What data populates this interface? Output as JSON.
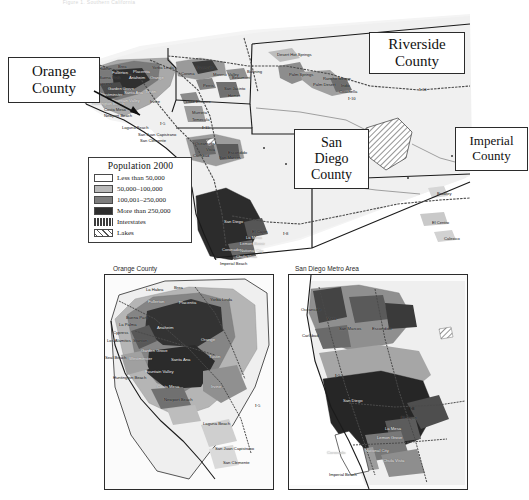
{
  "figure": {
    "top_caption": "Figure 1. Southern California"
  },
  "legend": {
    "title": "Population 2000",
    "items": [
      {
        "label": "Less than 50,000",
        "swatch": "#ffffff",
        "type": "area"
      },
      {
        "label": "50,000–100,000",
        "swatch": "#b9b9b9",
        "type": "area"
      },
      {
        "label": "100,001–250,000",
        "swatch": "#7d7d7d",
        "type": "area"
      },
      {
        "label": "More than 250,000",
        "swatch": "#2e2e2e",
        "type": "area"
      },
      {
        "label": "Interstates",
        "swatch": "#3c3c3c",
        "type": "road"
      },
      {
        "label": "Lakes",
        "swatch": "#ffffff",
        "type": "lake"
      }
    ]
  },
  "callouts": [
    {
      "name": "orange-county",
      "line1": "Orange",
      "line2": "County",
      "line3": ""
    },
    {
      "name": "riverside-county",
      "line1": "Riverside",
      "line2": "County",
      "line3": ""
    },
    {
      "name": "san-diego-county",
      "line1": "San",
      "line2": "Diego",
      "line3": "County"
    },
    {
      "name": "imperial-county",
      "line1": "Imperial",
      "line2": "County",
      "line3": ""
    }
  ],
  "main_map": {
    "cities": [
      {
        "name": "La Habra",
        "x": 93,
        "y": 59,
        "tone": "dark"
      },
      {
        "name": "Brea",
        "x": 118,
        "y": 57,
        "tone": "dark"
      },
      {
        "name": "Fullerton",
        "x": 112,
        "y": 63,
        "tone": "light"
      },
      {
        "name": "Placentia",
        "x": 133,
        "y": 62,
        "tone": "light"
      },
      {
        "name": "Yorba Linda",
        "x": 152,
        "y": 58,
        "tone": "dark"
      },
      {
        "name": "Anaheim",
        "x": 129,
        "y": 68,
        "tone": "light"
      },
      {
        "name": "Orange",
        "x": 150,
        "y": 68,
        "tone": "light"
      },
      {
        "name": "Buena Park",
        "x": 99,
        "y": 68,
        "tone": "dark"
      },
      {
        "name": "Cypress",
        "x": 97,
        "y": 74,
        "tone": "dark"
      },
      {
        "name": "Garden Grove",
        "x": 108,
        "y": 79,
        "tone": "light"
      },
      {
        "name": "Westminster",
        "x": 100,
        "y": 85,
        "tone": "light"
      },
      {
        "name": "Santa Ana",
        "x": 124,
        "y": 83,
        "tone": "light"
      },
      {
        "name": "Tustin",
        "x": 145,
        "y": 82,
        "tone": "light"
      },
      {
        "name": "Irvine",
        "x": 150,
        "y": 92,
        "tone": "dark"
      },
      {
        "name": "Huntington Beach",
        "x": 92,
        "y": 94,
        "tone": "light"
      },
      {
        "name": "Fountain Valley",
        "x": 112,
        "y": 91,
        "tone": "light"
      },
      {
        "name": "Costa Mesa",
        "x": 104,
        "y": 100,
        "tone": "dark"
      },
      {
        "name": "Newport Beach",
        "x": 104,
        "y": 106,
        "tone": "dark"
      },
      {
        "name": "Laguna Beach",
        "x": 122,
        "y": 118,
        "tone": "dark"
      },
      {
        "name": "San Juan Capistrano",
        "x": 138,
        "y": 125,
        "tone": "dark"
      },
      {
        "name": "San Clemente",
        "x": 140,
        "y": 131,
        "tone": "dark"
      },
      {
        "name": "Corona",
        "x": 181,
        "y": 64,
        "tone": "dark"
      },
      {
        "name": "Riverside",
        "x": 196,
        "y": 58,
        "tone": "dark"
      },
      {
        "name": "Moreno Valley",
        "x": 213,
        "y": 65,
        "tone": "dark"
      },
      {
        "name": "Lake Elsinore",
        "x": 186,
        "y": 92,
        "tone": "dark"
      },
      {
        "name": "Murrieta",
        "x": 192,
        "y": 103,
        "tone": "dark"
      },
      {
        "name": "Temecula",
        "x": 192,
        "y": 110,
        "tone": "dark"
      },
      {
        "name": "Perris",
        "x": 203,
        "y": 76,
        "tone": "dark"
      },
      {
        "name": "Hemet",
        "x": 228,
        "y": 86,
        "tone": "dark"
      },
      {
        "name": "San Jacinto",
        "x": 224,
        "y": 79,
        "tone": "dark"
      },
      {
        "name": "Beaumont",
        "x": 232,
        "y": 68,
        "tone": "dark"
      },
      {
        "name": "Banning",
        "x": 247,
        "y": 62,
        "tone": "dark"
      },
      {
        "name": "Desert Hot Springs",
        "x": 277,
        "y": 45,
        "tone": "dark"
      },
      {
        "name": "Palm Springs",
        "x": 289,
        "y": 65,
        "tone": "dark"
      },
      {
        "name": "Rancho Mirage",
        "x": 323,
        "y": 69,
        "tone": "dark"
      },
      {
        "name": "Palm Desert",
        "x": 313,
        "y": 75,
        "tone": "dark"
      },
      {
        "name": "Indio",
        "x": 341,
        "y": 76,
        "tone": "dark"
      },
      {
        "name": "Coachella",
        "x": 339,
        "y": 82,
        "tone": "dark"
      },
      {
        "name": "Oceanside",
        "x": 195,
        "y": 134,
        "tone": "dark"
      },
      {
        "name": "Vista",
        "x": 206,
        "y": 140,
        "tone": "dark"
      },
      {
        "name": "Carlsbad",
        "x": 193,
        "y": 146,
        "tone": "dark"
      },
      {
        "name": "San Marcos",
        "x": 219,
        "y": 148,
        "tone": "dark"
      },
      {
        "name": "Escondido",
        "x": 228,
        "y": 143,
        "tone": "dark"
      },
      {
        "name": "San Diego",
        "x": 224,
        "y": 212,
        "tone": "light"
      },
      {
        "name": "El Cajon",
        "x": 252,
        "y": 222,
        "tone": "dark"
      },
      {
        "name": "La Mesa",
        "x": 246,
        "y": 228,
        "tone": "light"
      },
      {
        "name": "Lemon Grove",
        "x": 240,
        "y": 234,
        "tone": "light"
      },
      {
        "name": "Coronado",
        "x": 222,
        "y": 240,
        "tone": "light"
      },
      {
        "name": "National City",
        "x": 240,
        "y": 241,
        "tone": "light"
      },
      {
        "name": "Chula Vista",
        "x": 236,
        "y": 247,
        "tone": "light"
      },
      {
        "name": "Imperial Beach",
        "x": 220,
        "y": 254,
        "tone": "dark"
      },
      {
        "name": "Brawley",
        "x": 437,
        "y": 184,
        "tone": "dark"
      },
      {
        "name": "El Centro",
        "x": 432,
        "y": 213,
        "tone": "dark"
      },
      {
        "name": "Calexico",
        "x": 444,
        "y": 229,
        "tone": "dark"
      }
    ],
    "interstate_shields": [
      {
        "label": "I-5",
        "x": 160,
        "y": 113
      },
      {
        "label": "I-15",
        "x": 202,
        "y": 117
      },
      {
        "label": "I-8",
        "x": 283,
        "y": 223
      },
      {
        "label": "I-10",
        "x": 348,
        "y": 88
      },
      {
        "label": "I-10",
        "x": 419,
        "y": 79
      }
    ]
  },
  "insets": [
    {
      "name": "orange-county-inset",
      "title": "Orange County",
      "cities": [
        {
          "name": "La Habra",
          "x": 41,
          "y": 13,
          "tone": "dark"
        },
        {
          "name": "Brea",
          "x": 69,
          "y": 11,
          "tone": "dark"
        },
        {
          "name": "Fullerton",
          "x": 43,
          "y": 25,
          "tone": "light"
        },
        {
          "name": "Placentia",
          "x": 74,
          "y": 26,
          "tone": "light"
        },
        {
          "name": "Yorba Linda",
          "x": 105,
          "y": 23,
          "tone": "dark"
        },
        {
          "name": "Buena Park",
          "x": 21,
          "y": 41,
          "tone": "dark"
        },
        {
          "name": "La Palma",
          "x": 14,
          "y": 48,
          "tone": "dark"
        },
        {
          "name": "Cypress",
          "x": 8,
          "y": 56,
          "tone": "dark"
        },
        {
          "name": "Los Alamitos",
          "x": 2,
          "y": 64,
          "tone": "dark"
        },
        {
          "name": "Stanton",
          "x": 28,
          "y": 64,
          "tone": "dark"
        },
        {
          "name": "Anaheim",
          "x": 52,
          "y": 51,
          "tone": "light"
        },
        {
          "name": "Orange",
          "x": 96,
          "y": 63,
          "tone": "light"
        },
        {
          "name": "Garden Grove",
          "x": 36,
          "y": 74,
          "tone": "light"
        },
        {
          "name": "Seal Beach",
          "x": 0,
          "y": 81,
          "tone": "dark"
        },
        {
          "name": "Westminster",
          "x": 24,
          "y": 82,
          "tone": "light"
        },
        {
          "name": "Santa Ana",
          "x": 66,
          "y": 83,
          "tone": "light"
        },
        {
          "name": "Tustin",
          "x": 104,
          "y": 80,
          "tone": "light"
        },
        {
          "name": "Fountain Valley",
          "x": 40,
          "y": 95,
          "tone": "light"
        },
        {
          "name": "Huntington Beach",
          "x": 8,
          "y": 101,
          "tone": "dark"
        },
        {
          "name": "Costa Mesa",
          "x": 52,
          "y": 110,
          "tone": "light"
        },
        {
          "name": "Irvine",
          "x": 106,
          "y": 110,
          "tone": "light"
        },
        {
          "name": "Newport Beach",
          "x": 59,
          "y": 123,
          "tone": "dark"
        },
        {
          "name": "Laguna Beach",
          "x": 98,
          "y": 147,
          "tone": "dark"
        },
        {
          "name": "San Juan Capistrano",
          "x": 110,
          "y": 172,
          "tone": "dark"
        },
        {
          "name": "San Clemente",
          "x": 118,
          "y": 186,
          "tone": "dark"
        }
      ],
      "shields": [
        {
          "label": "I-5",
          "x": 150,
          "y": 128
        }
      ]
    },
    {
      "name": "san-diego-metro-inset",
      "title": "San Diego Metro Area",
      "cities": [
        {
          "name": "Oceanside",
          "x": 12,
          "y": 33,
          "tone": "dark"
        },
        {
          "name": "Vista",
          "x": 38,
          "y": 42,
          "tone": "dark"
        },
        {
          "name": "Carlsbad",
          "x": 13,
          "y": 59,
          "tone": "dark"
        },
        {
          "name": "San Marcos",
          "x": 50,
          "y": 52,
          "tone": "dark"
        },
        {
          "name": "Escondido",
          "x": 83,
          "y": 52,
          "tone": "dark"
        },
        {
          "name": "San Diego",
          "x": 54,
          "y": 124,
          "tone": "light"
        },
        {
          "name": "El Cajon",
          "x": 112,
          "y": 141,
          "tone": "dark"
        },
        {
          "name": "La Mesa",
          "x": 96,
          "y": 152,
          "tone": "light"
        },
        {
          "name": "Lemon Grove",
          "x": 88,
          "y": 161,
          "tone": "light"
        },
        {
          "name": "Coronado",
          "x": 38,
          "y": 176,
          "tone": "light"
        },
        {
          "name": "National City",
          "x": 76,
          "y": 174,
          "tone": "light"
        },
        {
          "name": "Chula Vista",
          "x": 94,
          "y": 184,
          "tone": "light"
        },
        {
          "name": "Imperial Beach",
          "x": 40,
          "y": 198,
          "tone": "dark"
        }
      ],
      "shields": [
        {
          "label": "I-8",
          "x": 120,
          "y": 131
        },
        {
          "label": "I-5",
          "x": 46,
          "y": 98
        }
      ]
    }
  ]
}
